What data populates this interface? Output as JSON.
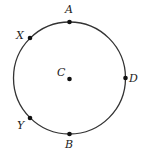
{
  "diagram": {
    "type": "circle",
    "center": {
      "label": "C",
      "x": 69.5,
      "y": 78
    },
    "radius": 56,
    "stroke_color": "#333333",
    "points": [
      {
        "label": "A",
        "x": 69.5,
        "y": 22,
        "label_x": 65,
        "label_y": 13
      },
      {
        "label": "X",
        "x": 30,
        "y": 38,
        "label_x": 16,
        "label_y": 39
      },
      {
        "label": "D",
        "x": 125.5,
        "y": 78,
        "label_x": 129,
        "label_y": 82
      },
      {
        "label": "Y",
        "x": 30,
        "y": 118,
        "label_x": 17,
        "label_y": 129
      },
      {
        "label": "B",
        "x": 69.5,
        "y": 134,
        "label_x": 65,
        "label_y": 148
      }
    ],
    "center_label_pos": {
      "x": 57,
      "y": 76
    }
  }
}
